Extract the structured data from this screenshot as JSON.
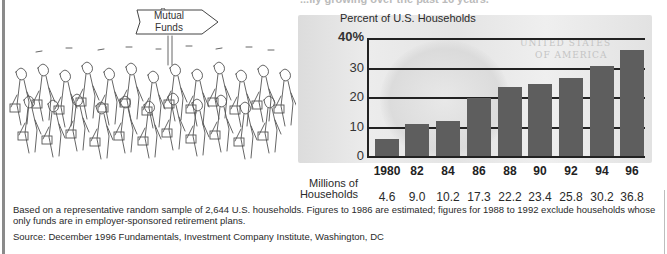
{
  "header": {
    "partial_title": "...ily growing over the past 16 years."
  },
  "illustration": {
    "sign_line1": "Mutual",
    "sign_line2": "Funds",
    "description": "crowd of cartoon business people with briefcases marching toward a Mutual Funds sign"
  },
  "chart_data": {
    "type": "bar",
    "title": "Percent of U.S. Households",
    "xlabel": "",
    "ylabel": "Percent of U.S. Households",
    "ylim": [
      0,
      40
    ],
    "y_ticks": [
      "0",
      "10",
      "20",
      "30",
      "40%"
    ],
    "grid": true,
    "categories": [
      "1980",
      "82",
      "84",
      "86",
      "88",
      "90",
      "92",
      "94",
      "96"
    ],
    "values": [
      6,
      11,
      12,
      20,
      23.5,
      24.5,
      26.5,
      30.5,
      36
    ],
    "secondary_row": {
      "label_line1": "Millions of",
      "label_line2": "Households",
      "values": [
        "4.6",
        "9.0",
        "10.2",
        "17.3",
        "22.2",
        "23.4",
        "25.8",
        "30.2",
        "36.8"
      ]
    },
    "bar_color": "#5e5e5e",
    "background": "U.S. $100 bill image"
  },
  "footnote": {
    "note": "Based on a representative random sample of 2,644 U.S. households. Figures to 1986 are estimated; figures for 1988 to 1992 exclude households whose only funds are in employer-sponsored retirement plans.",
    "source": "Source: December 1996 Fundamentals, Investment Company Institute, Washington, DC"
  },
  "bill_decor": {
    "line1": "UNITED STATES",
    "line2": "OF AMERICA"
  }
}
